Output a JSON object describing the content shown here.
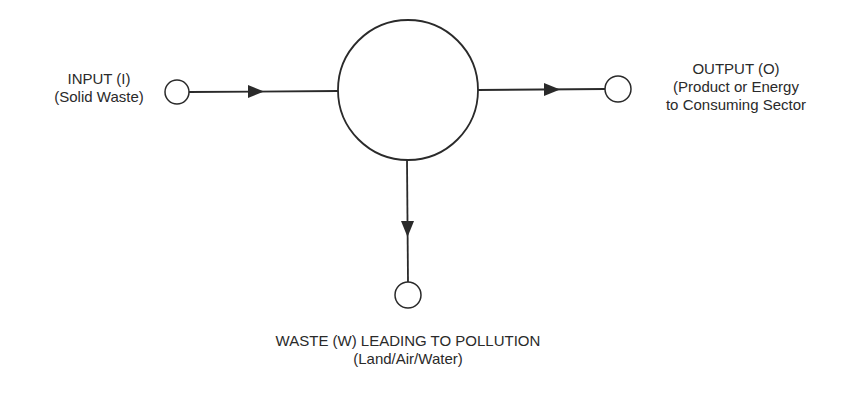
{
  "diagram": {
    "type": "process-flow",
    "nodes": [
      {
        "id": "input",
        "title": "INPUT (I)",
        "subtitle": "(Solid Waste)"
      },
      {
        "id": "process",
        "title": "",
        "subtitle": ""
      },
      {
        "id": "output",
        "title": "OUTPUT (O)",
        "subtitle_lines": [
          "(Product or Energy",
          "to Consuming Sector"
        ]
      },
      {
        "id": "waste",
        "title": "WASTE (W) LEADING TO POLLUTION",
        "subtitle": "(Land/Air/Water)"
      }
    ],
    "edges": [
      {
        "from": "input",
        "to": "process"
      },
      {
        "from": "process",
        "to": "output"
      },
      {
        "from": "process",
        "to": "waste"
      }
    ]
  },
  "labels": {
    "input_title": "INPUT (I)",
    "input_subtitle": "(Solid Waste)",
    "output_title": "OUTPUT (O)",
    "output_line2": "(Product or Energy",
    "output_line3": "to Consuming Sector",
    "waste_title": "WASTE (W) LEADING TO POLLUTION",
    "waste_subtitle": "(Land/Air/Water)"
  },
  "colors": {
    "stroke": "#2a2a2a",
    "background": "#ffffff"
  }
}
